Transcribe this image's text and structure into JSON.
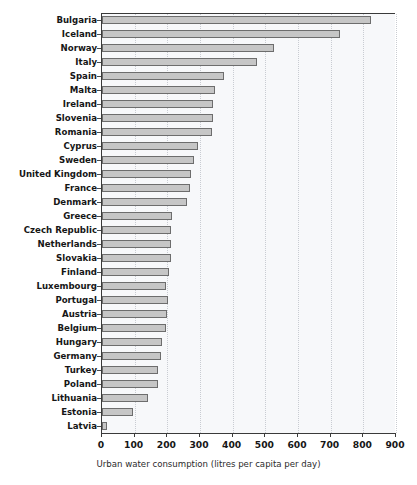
{
  "chart_data": {
    "type": "bar",
    "orientation": "horizontal",
    "title": "",
    "xlabel": "Urban water consumption (litres per capita per day)",
    "ylabel": "",
    "xlim": [
      0,
      900
    ],
    "xticks": [
      0,
      100,
      200,
      300,
      400,
      500,
      600,
      700,
      800,
      900
    ],
    "grid": "vertical-dotted",
    "legend": "none",
    "categories": [
      "Bulgaria",
      "Iceland",
      "Norway",
      "Italy",
      "Spain",
      "Malta",
      "Ireland",
      "Slovenia",
      "Romania",
      "Cyprus",
      "Sweden",
      "United Kingdom",
      "France",
      "Denmark",
      "Greece",
      "Czech Republic",
      "Netherlands",
      "Slovakia",
      "Finland",
      "Luxembourg",
      "Portugal",
      "Austria",
      "Belgium",
      "Hungary",
      "Germany",
      "Turkey",
      "Poland",
      "Lithuania",
      "Estonia",
      "Latvia"
    ],
    "values": [
      823,
      728,
      525,
      473,
      372,
      347,
      341,
      341,
      338,
      295,
      283,
      273,
      270,
      261,
      215,
      212,
      212,
      212,
      206,
      197,
      203,
      200,
      197,
      184,
      181,
      172,
      172,
      141,
      95,
      15
    ],
    "colors": {
      "bar_fill": "#c6c6c6",
      "bar_edge": "#6d6d6d",
      "plot_background": "#f7f8fa",
      "gridline": "#c9ccd2",
      "axis": "#3a3a3a",
      "text": "#161616"
    }
  }
}
